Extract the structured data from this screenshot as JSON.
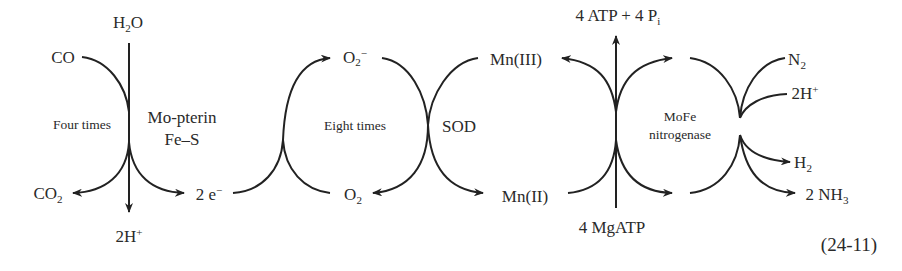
{
  "equation_number": "(24-11)",
  "cycle_co": {
    "substrate": {
      "base": "CO"
    },
    "product": {
      "base": "CO",
      "sub": "2"
    },
    "water_in": {
      "pre": "H",
      "sub": "2",
      "post": "O"
    },
    "protons_out": {
      "base": "2H",
      "sup": "+"
    },
    "electrons_out": {
      "base": "2 e",
      "sup": "−"
    },
    "enzyme_line1": "Mo-pterin",
    "enzyme_line2": "Fe–S",
    "repeat_label": "Four times"
  },
  "cycle_sod": {
    "superoxide": {
      "base": "O",
      "sub": "2",
      "sup": "−"
    },
    "oxygen": {
      "base": "O",
      "sub": "2"
    },
    "repeat_label": "Eight times",
    "enzyme": "SOD",
    "mn_oxidized": "Mn(III)",
    "mn_reduced": "Mn(II)"
  },
  "cycle_nitrogenase": {
    "atp_out": {
      "base": "4 ATP + 4 P",
      "sub": "i"
    },
    "atp_in": "4 MgATP",
    "enzyme_line1": "MoFe",
    "enzyme_line2": "nitrogenase",
    "n2": {
      "base": "N",
      "sub": "2"
    },
    "protons_in": {
      "base": "2H",
      "sup": "+"
    },
    "h2": {
      "base": "H",
      "sub": "2"
    },
    "nh3": {
      "base": "2 NH",
      "sub": "3"
    }
  }
}
